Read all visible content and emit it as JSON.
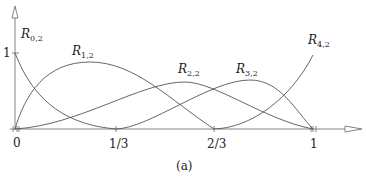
{
  "caption": "(a)",
  "axis": {
    "y_tick_label": "1",
    "x_tick_labels": [
      "0",
      "1/3",
      "2/3",
      "1"
    ]
  },
  "curves": [
    {
      "name": "R",
      "sub": "0,2"
    },
    {
      "name": "R",
      "sub": "1,2"
    },
    {
      "name": "R",
      "sub": "2,2"
    },
    {
      "name": "R",
      "sub": "3,2"
    },
    {
      "name": "R",
      "sub": "4,2"
    }
  ],
  "colors": {
    "stroke": "#555555",
    "axis": "#777777"
  }
}
